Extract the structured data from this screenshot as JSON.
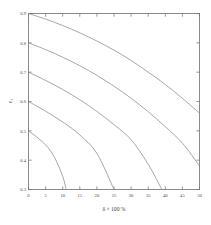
{
  "chart_data": {
    "type": "line",
    "title": "",
    "subtitle": "",
    "xlabel": "δ × 100 %",
    "ylabel": "ε",
    "ylabel_sub": "r",
    "xlim": [
      0,
      50
    ],
    "ylim": [
      0.3,
      0.9
    ],
    "grid": false,
    "legend": "none",
    "xticks": [
      0,
      5,
      10,
      15,
      20,
      25,
      30,
      35,
      40,
      45,
      50
    ],
    "xtick_labels": [
      "0",
      "5",
      "10",
      "15",
      "20",
      "25",
      "30",
      "35",
      "40",
      "45",
      "50"
    ],
    "yticks": [
      0.3,
      0.4,
      0.5,
      0.6,
      0.7,
      0.8,
      0.9
    ],
    "ytick_labels": [
      "0.3",
      "0.4",
      "0.5",
      "0.6",
      "0.7",
      "0.8",
      "0.9"
    ],
    "series": [
      {
        "name": "curve-1",
        "start_value": 0.9,
        "x": [
          0,
          5,
          10,
          15,
          20,
          25,
          30,
          35,
          40,
          45,
          50
        ],
        "values": [
          0.9,
          0.881,
          0.859,
          0.834,
          0.806,
          0.775,
          0.74,
          0.7,
          0.658,
          0.611,
          0.56
        ]
      },
      {
        "name": "curve-2",
        "start_value": 0.8,
        "x": [
          0,
          5,
          10,
          15,
          20,
          25,
          30,
          35,
          40,
          45,
          50
        ],
        "values": [
          0.8,
          0.777,
          0.751,
          0.722,
          0.689,
          0.652,
          0.611,
          0.565,
          0.514,
          0.458,
          0.38
        ]
      },
      {
        "name": "curve-3",
        "start_value": 0.7,
        "x": [
          0,
          5,
          10,
          15,
          20,
          25,
          30,
          35,
          39
        ],
        "values": [
          0.7,
          0.672,
          0.641,
          0.606,
          0.566,
          0.521,
          0.47,
          0.386,
          0.3
        ]
      },
      {
        "name": "curve-4",
        "start_value": 0.6,
        "x": [
          0,
          5,
          10,
          15,
          20,
          25
        ],
        "values": [
          0.6,
          0.567,
          0.53,
          0.486,
          0.423,
          0.3
        ]
      },
      {
        "name": "curve-5",
        "start_value": 0.5,
        "x": [
          0,
          2.5,
          5,
          7.5,
          10,
          11
        ],
        "values": [
          0.5,
          0.478,
          0.452,
          0.412,
          0.345,
          0.3
        ]
      }
    ],
    "colors": {
      "curve": "#8a8a8a",
      "axis": "#6f6f6f",
      "background": "#ffffff",
      "text": "#4a4a4a"
    }
  }
}
